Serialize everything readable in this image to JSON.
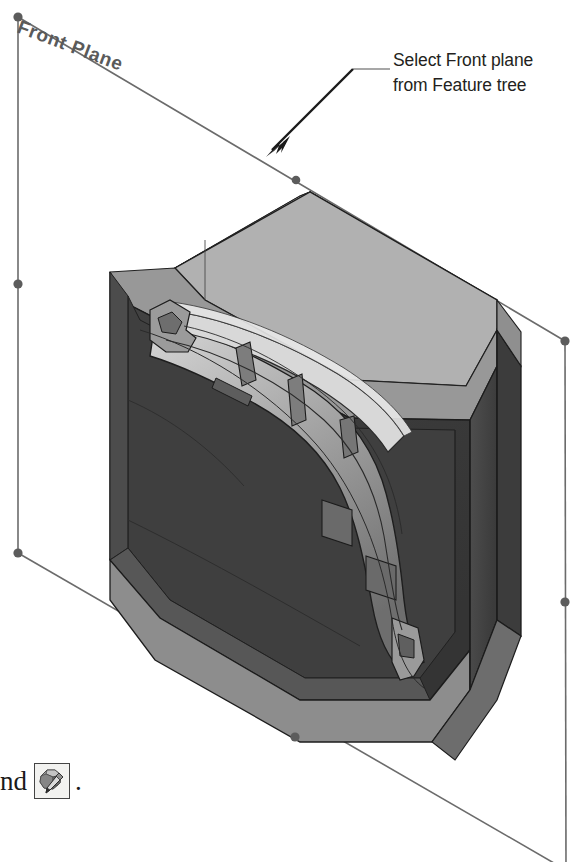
{
  "document": {
    "type": "cad-illustration",
    "background_color": "#ffffff"
  },
  "plane": {
    "label": "Front Plane",
    "label_color": "#5a5a5a",
    "border_color": "#6b6b6b",
    "handle_color": "#5c5c5c",
    "handles": [
      {
        "name": "corner-top-left",
        "x": 18,
        "y": 17
      },
      {
        "name": "midpoint-top",
        "x": 296,
        "y": 180
      },
      {
        "name": "corner-top-right",
        "x": 565,
        "y": 341
      },
      {
        "name": "midpoint-left",
        "x": 18,
        "y": 284
      },
      {
        "name": "midpoint-right",
        "x": 565,
        "y": 602
      },
      {
        "name": "corner-bottom-left",
        "x": 18,
        "y": 553
      },
      {
        "name": "midpoint-bottom",
        "x": 295,
        "y": 737
      },
      {
        "name": "corner-bottom-right",
        "x": 566,
        "y": 862
      }
    ]
  },
  "callout": {
    "line1": "Select Front plane",
    "line2": "from Feature tree",
    "text_color": "#231f20",
    "leader_color": "#7c7c7c",
    "arrow_color": "#1a1a1a"
  },
  "caption": {
    "text_before": "nd",
    "icon_name": "edit-sketch-icon",
    "text_after": "."
  },
  "model": {
    "name": "mold-block-with-part",
    "colors": {
      "top_face": "#b4b4b4",
      "top_chamfer": "#9a9a9a",
      "front_face": "#3c3c3c",
      "front_face_light": "#555555",
      "side_face": "#4a4a4a",
      "side_face_dark": "#353535",
      "bottom_band": "#8e8e8e",
      "inner_cavity": "#5e5e5e",
      "part_light": "#c8c8c8",
      "part_mid": "#8a8a8a",
      "part_dark": "#4a4a4a",
      "edge": "#1c1c1c"
    }
  }
}
